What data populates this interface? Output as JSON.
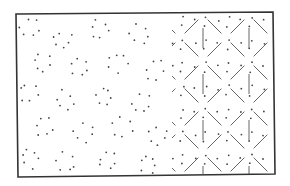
{
  "figure": {
    "width": 290,
    "height": 186,
    "colors": {
      "background": "#ffffff",
      "frame": "#333333",
      "dots": "#444444",
      "lines": "#666666"
    },
    "frame": {
      "points": [
        [
          16,
          14
        ],
        [
          273,
          12
        ],
        [
          275,
          174
        ],
        [
          18,
          177
        ]
      ],
      "stroke_width": 1.6
    },
    "dot_field": {
      "cluster_centers": [
        [
          30,
          28
        ],
        [
          62,
          40
        ],
        [
          100,
          30
        ],
        [
          140,
          34
        ],
        [
          42,
          62
        ],
        [
          80,
          66
        ],
        [
          118,
          62
        ],
        [
          155,
          70
        ],
        [
          28,
          92
        ],
        [
          64,
          100
        ],
        [
          104,
          96
        ],
        [
          142,
          104
        ],
        [
          44,
          126
        ],
        [
          84,
          132
        ],
        [
          122,
          128
        ],
        [
          158,
          136
        ],
        [
          30,
          158
        ],
        [
          66,
          162
        ],
        [
          108,
          160
        ],
        [
          148,
          164
        ]
      ],
      "cluster_radius": 9,
      "dots_per_cluster": 6,
      "dot_radius": 0.9
    },
    "lattice": {
      "x_start": 176,
      "x_end": 273,
      "y_start": 14,
      "y_end": 174,
      "cell": 46,
      "node_columns": [
        180,
        226,
        272
      ],
      "node_rows": [
        38,
        84,
        130,
        176
      ],
      "vertical_stroke_columns": [
        203,
        249
      ],
      "vertical_stroke_rows": [
        38,
        61,
        107,
        153
      ],
      "vertical_stroke_half_length": 10
    }
  }
}
